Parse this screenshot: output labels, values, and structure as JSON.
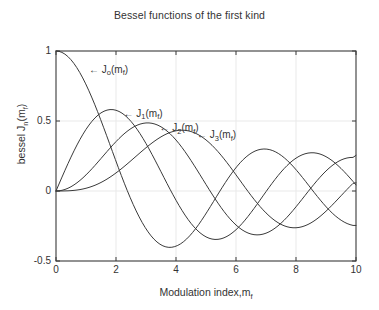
{
  "figure": {
    "background": "#ffffff",
    "axis_color": "#3a3a3a",
    "grid_color": "#e9e9e9",
    "curve_color": "#3a3a3a"
  },
  "chart_data": {
    "type": "line",
    "title": "Bessel functions of the first kind",
    "xlabel_main": "Modulation index,m",
    "xlabel_sub": "f",
    "ylabel_main_pre": "bessel J",
    "ylabel_sub_n": "n",
    "ylabel_main_post": "(m",
    "ylabel_sub_f": "f",
    "ylabel_main_end": ")",
    "xlim": [
      0,
      10
    ],
    "ylim": [
      -0.5,
      1
    ],
    "xticks": [
      "0",
      "2",
      "4",
      "6",
      "8",
      "10"
    ],
    "xtick_values": [
      0,
      2,
      4,
      6,
      8,
      10
    ],
    "yticks": [
      "1",
      "0.5",
      "0",
      "-0.5"
    ],
    "ytick_values": [
      1,
      0.5,
      0,
      -0.5
    ],
    "grid": true,
    "legend_position": "inline-annotations",
    "series": [
      {
        "name": "J0(mf)",
        "label_prefix": "← J",
        "label_sub": "o",
        "label_suffix": "(m",
        "label_sub2": "f",
        "label_end": ")",
        "anno_x": 1.1,
        "anno_y": 0.86,
        "values": [
          1.0,
          0.9975,
          0.99,
          0.9776,
          0.9604,
          0.9385,
          0.912,
          0.8812,
          0.8463,
          0.8075,
          0.7652,
          0.7196,
          0.6711,
          0.6201,
          0.5669,
          0.5118,
          0.4554,
          0.398,
          0.34,
          0.2818,
          0.2239,
          0.1666,
          0.1104,
          0.0555,
          0.0025,
          -0.0484,
          -0.0968,
          -0.1424,
          -0.185,
          -0.2243,
          -0.2601,
          -0.2921,
          -0.3202,
          -0.3443,
          -0.3643,
          -0.3801,
          -0.3918,
          -0.3992,
          -0.4026,
          -0.4018,
          -0.3971,
          -0.3887,
          -0.3766,
          -0.361,
          -0.3423,
          -0.3205,
          -0.2961,
          -0.2693,
          -0.2404,
          -0.2097,
          -0.1776,
          -0.1443,
          -0.1103,
          -0.0758,
          -0.0412,
          -0.0068,
          0.027,
          0.0599,
          0.0917,
          0.122,
          0.1506,
          0.1773,
          0.2017,
          0.2238,
          0.2433,
          0.2601,
          0.274,
          0.2851,
          0.2931,
          0.2981,
          0.3001,
          0.2991,
          0.2951,
          0.2882,
          0.2786,
          0.2663,
          0.2516,
          0.2346,
          0.2154,
          0.1944,
          0.1717,
          0.1475,
          0.1222,
          0.096,
          0.0692,
          0.0419,
          0.0146,
          -0.0125,
          -0.0392,
          -0.0653,
          -0.0903,
          -0.1142,
          -0.1367,
          -0.1577,
          -0.1768,
          -0.1939,
          -0.209,
          -0.2218,
          -0.2323,
          -0.2403,
          -0.2459,
          -0.2459
        ]
      },
      {
        "name": "J1(mf)",
        "label_prefix": "← J",
        "label_sub": "1",
        "label_suffix": "(m",
        "label_sub2": "f",
        "label_end": ")",
        "anno_x": 2.25,
        "anno_y": 0.545,
        "values": [
          0.0,
          0.0499,
          0.0995,
          0.1483,
          0.196,
          0.2423,
          0.2867,
          0.329,
          0.3688,
          0.4059,
          0.4401,
          0.4709,
          0.4983,
          0.522,
          0.5419,
          0.5579,
          0.5699,
          0.5778,
          0.5815,
          0.5812,
          0.5767,
          0.5683,
          0.556,
          0.5399,
          0.5202,
          0.4971,
          0.4708,
          0.4416,
          0.4097,
          0.3754,
          0.3391,
          0.3009,
          0.2613,
          0.2207,
          0.1792,
          0.1374,
          0.0955,
          0.0538,
          0.0128,
          -0.0272,
          -0.066,
          -0.1033,
          -0.1386,
          -0.1719,
          -0.2028,
          -0.2311,
          -0.2566,
          -0.2791,
          -0.2985,
          -0.3147,
          -0.3276,
          -0.3371,
          -0.3432,
          -0.346,
          -0.3453,
          -0.3414,
          -0.3343,
          -0.3241,
          -0.311,
          -0.2951,
          -0.2767,
          -0.2559,
          -0.2329,
          -0.2081,
          -0.1816,
          -0.1538,
          -0.125,
          -0.0953,
          -0.0652,
          -0.0349,
          -0.0047,
          0.0252,
          0.0543,
          0.0826,
          0.1096,
          0.1352,
          0.1592,
          0.1813,
          0.2014,
          0.2192,
          0.2346,
          0.2476,
          0.258,
          0.2657,
          0.2708,
          0.2731,
          0.2728,
          0.2697,
          0.2641,
          0.2559,
          0.2453,
          0.2324,
          0.2174,
          0.2004,
          0.1816,
          0.1613,
          0.1395,
          0.1166,
          0.0928,
          0.0684,
          0.0435
        ]
      },
      {
        "name": "J2(mf)",
        "label_prefix": "← J",
        "label_sub": "2",
        "label_suffix": "(m",
        "label_sub2": "f",
        "label_end": ")",
        "anno_x": 3.45,
        "anno_y": 0.44,
        "values": [
          0.0,
          0.0012,
          0.005,
          0.0112,
          0.0197,
          0.0306,
          0.0437,
          0.0588,
          0.0758,
          0.0946,
          0.1149,
          0.1366,
          0.1593,
          0.183,
          0.2074,
          0.2321,
          0.257,
          0.2817,
          0.3061,
          0.3299,
          0.3528,
          0.3746,
          0.3951,
          0.4139,
          0.431,
          0.4461,
          0.459,
          0.4696,
          0.4777,
          0.4832,
          0.4861,
          0.4862,
          0.4835,
          0.478,
          0.4697,
          0.4586,
          0.4448,
          0.4283,
          0.4093,
          0.3879,
          0.3641,
          0.3383,
          0.3105,
          0.2811,
          0.2501,
          0.2178,
          0.1846,
          0.1506,
          0.1161,
          0.0813,
          0.0466,
          0.0121,
          -0.0217,
          -0.0547,
          -0.0867,
          -0.1173,
          -0.1464,
          -0.1737,
          -0.199,
          -0.2221,
          -0.2429,
          -0.2612,
          -0.2769,
          -0.2899,
          -0.3001,
          -0.3074,
          -0.3119,
          -0.3135,
          -0.3123,
          -0.3082,
          -0.3014,
          -0.292,
          -0.28,
          -0.2656,
          -0.249,
          -0.2303,
          -0.2097,
          -0.1875,
          -0.1638,
          -0.1389,
          -0.113,
          -0.0864,
          -0.0594,
          -0.0322,
          -0.005,
          0.0219,
          0.0482,
          0.0738,
          0.0982,
          0.1214,
          0.143,
          0.1629,
          0.1808,
          0.1966,
          0.2101,
          0.2212,
          0.2298,
          0.2358,
          0.2391,
          0.2399,
          0.2546
        ]
      },
      {
        "name": "J3(mf)",
        "label_prefix": "← J",
        "label_sub": "3",
        "label_suffix": "(m",
        "label_sub2": "f",
        "label_end": ")",
        "anno_x": 4.7,
        "anno_y": 0.39,
        "values": [
          0.0,
          0.0,
          0.0002,
          0.0006,
          0.0013,
          0.0026,
          0.0044,
          0.0069,
          0.0102,
          0.0144,
          0.0196,
          0.0257,
          0.0329,
          0.0411,
          0.0505,
          0.061,
          0.0725,
          0.0851,
          0.0988,
          0.1134,
          0.1289,
          0.1453,
          0.1623,
          0.18,
          0.1981,
          0.2166,
          0.2353,
          0.254,
          0.2727,
          0.2911,
          0.3091,
          0.3264,
          0.3431,
          0.3588,
          0.3734,
          0.3868,
          0.3988,
          0.4092,
          0.418,
          0.425,
          0.4302,
          0.4333,
          0.4344,
          0.4333,
          0.4301,
          0.4247,
          0.4171,
          0.4072,
          0.3952,
          0.3811,
          0.3648,
          0.3466,
          0.3265,
          0.3046,
          0.2811,
          0.2561,
          0.2298,
          0.2023,
          0.1739,
          0.1448,
          0.1153,
          0.0855,
          0.0557,
          0.0261,
          -0.003,
          -0.0314,
          -0.0589,
          -0.0854,
          -0.1106,
          -0.1344,
          -0.1566,
          -0.177,
          -0.1955,
          -0.212,
          -0.2263,
          -0.2383,
          -0.248,
          -0.2553,
          -0.2602,
          -0.2626,
          -0.2626,
          -0.2602,
          -0.2554,
          -0.2483,
          -0.239,
          -0.2276,
          -0.2142,
          -0.199,
          -0.1821,
          -0.1638,
          -0.1442,
          -0.1235,
          -0.1019,
          -0.0797,
          -0.0571,
          -0.0343,
          -0.0115,
          0.011,
          0.0331,
          0.0546,
          0.0584
        ]
      }
    ]
  }
}
